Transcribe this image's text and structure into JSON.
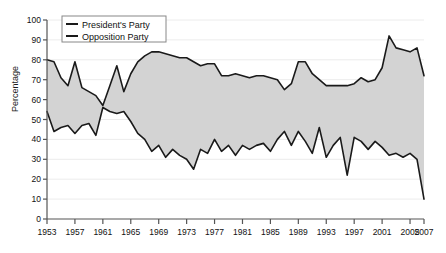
{
  "chart_data": {
    "type": "area",
    "title": "",
    "xlabel": "",
    "ylabel": "Percentage",
    "xlim": [
      1953,
      2007
    ],
    "ylim": [
      0,
      100
    ],
    "grid": true,
    "legend_position": "top-left",
    "yticks": [
      0,
      10,
      20,
      30,
      40,
      50,
      60,
      70,
      80,
      90,
      100
    ],
    "xticks": [
      1953,
      1957,
      1961,
      1965,
      1969,
      1973,
      1977,
      1981,
      1985,
      1989,
      1993,
      1997,
      2001,
      2005,
      2007
    ],
    "x": [
      1953,
      1954,
      1955,
      1956,
      1957,
      1958,
      1959,
      1960,
      1961,
      1962,
      1963,
      1964,
      1965,
      1966,
      1967,
      1968,
      1969,
      1970,
      1971,
      1972,
      1973,
      1974,
      1975,
      1976,
      1977,
      1978,
      1979,
      1980,
      1981,
      1982,
      1983,
      1984,
      1985,
      1986,
      1987,
      1988,
      1989,
      1990,
      1991,
      1992,
      1993,
      1994,
      1995,
      1996,
      1997,
      1998,
      1999,
      2000,
      2001,
      2002,
      2003,
      2004,
      2005,
      2006,
      2007
    ],
    "series": [
      {
        "name": "President's Party",
        "color": "#1a1a1a",
        "values": [
          80,
          79,
          71,
          67,
          79,
          66,
          64,
          62,
          57,
          67,
          77,
          64,
          73,
          79,
          82,
          84,
          84,
          83,
          82,
          81,
          81,
          79,
          77,
          78,
          78,
          72,
          72,
          73,
          72,
          71,
          72,
          72,
          71,
          70,
          65,
          68,
          79,
          79,
          73,
          70,
          67,
          67,
          67,
          67,
          68,
          71,
          69,
          70,
          76,
          92,
          86,
          85,
          84,
          86,
          72
        ]
      },
      {
        "name": "Opposition Party",
        "color": "#1a1a1a",
        "values": [
          54,
          44,
          46,
          47,
          43,
          47,
          48,
          42,
          56,
          54,
          53,
          54,
          49,
          43,
          40,
          34,
          37,
          31,
          35,
          32,
          30,
          25,
          35,
          33,
          40,
          34,
          37,
          32,
          37,
          35,
          37,
          38,
          34,
          40,
          44,
          37,
          44,
          39,
          33,
          46,
          31,
          37,
          41,
          22,
          41,
          39,
          35,
          39,
          36,
          32,
          33,
          31,
          33,
          30,
          10
        ]
      }
    ]
  },
  "legend": {
    "items": [
      {
        "label": "President's Party"
      },
      {
        "label": "Opposition Party"
      }
    ]
  },
  "axis": {
    "y_title": "Percentage"
  },
  "colors": {
    "fill": "#d3d3d3",
    "line": "#1a1a1a",
    "grid": "#ececec",
    "axis": "#555555",
    "legend_border": "#888888"
  }
}
